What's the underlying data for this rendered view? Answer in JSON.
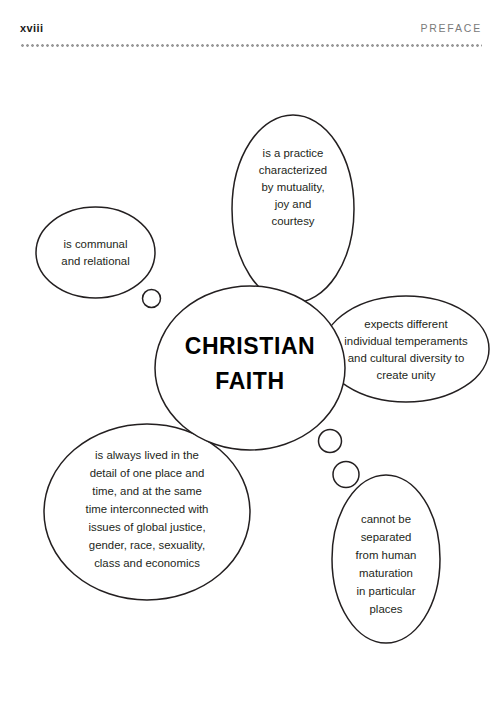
{
  "header": {
    "folio": "xviii",
    "running_title": "PREFACE",
    "rule_color": "#9a9a9a"
  },
  "diagram": {
    "stroke_color": "#231f20",
    "fill_color": "#ffffff",
    "center": {
      "label": "CHRISTIAN FAITH",
      "lines": [
        "CHRISTIAN",
        "FAITH"
      ]
    },
    "bubbles": [
      {
        "id": "communal",
        "lines": [
          "is communal",
          "and relational"
        ]
      },
      {
        "id": "practice",
        "lines": [
          "is a practice",
          "characterized",
          "by mutuality,",
          "joy and",
          "courtesy"
        ]
      },
      {
        "id": "diversity",
        "lines": [
          "expects different",
          "individual temperaments",
          "and cultural diversity to",
          "create unity"
        ]
      },
      {
        "id": "located",
        "lines": [
          "is always lived in the",
          "detail of one place and",
          "time, and at the same",
          "time interconnected with",
          "issues of global justice,",
          "gender, race, sexuality,",
          "class and economics"
        ]
      },
      {
        "id": "maturation",
        "lines": [
          "cannot be",
          "separated",
          "from human",
          "maturation",
          "in particular",
          "places"
        ]
      }
    ],
    "connector_count": 3
  }
}
